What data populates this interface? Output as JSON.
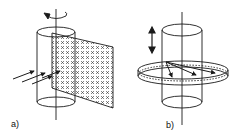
{
  "diagram": {
    "panels": [
      {
        "label": "a)",
        "description": "Rotating cylinder with a flat sheet grid of x marks passing through its axis; parallel arrows incident from the left",
        "elements": [
          "cylinder",
          "rotation-axis",
          "rotation-arrow",
          "flat-grid-sheet",
          "incident-arrows"
        ]
      },
      {
        "label": "b)",
        "description": "Cylinder with an annular ring of x marks around it; vertical double arrow indicating translation; arrows within ring",
        "elements": [
          "cylinder",
          "axis",
          "vertical-double-arrow",
          "annular-ring",
          "inner-arrows"
        ]
      }
    ],
    "grid_mark": "x",
    "stroke_color": "#1a1a1a"
  }
}
